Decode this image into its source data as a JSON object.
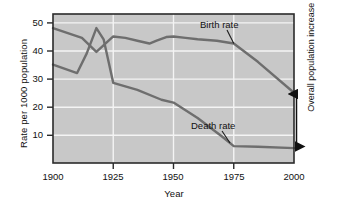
{
  "chart_data": {
    "type": "line",
    "title": "",
    "xlabel": "Year",
    "ylabel": "Rate per 1000 population",
    "xlim": [
      1900,
      2000
    ],
    "ylim": [
      0,
      53
    ],
    "xticks": [
      1900,
      1925,
      1950,
      1975,
      2000
    ],
    "yticks": [
      10,
      20,
      30,
      40,
      50
    ],
    "grid": true,
    "legend_position": "inline-annotations",
    "background_color": "#c8c8c8",
    "gridline_color": "#f2f2f2",
    "line_color": "#6b6b6b",
    "border_color": "#2b2b2b",
    "series": [
      {
        "name": "Birth rate",
        "x": [
          1900,
          1912,
          1918,
          1925,
          1930,
          1935,
          1940,
          1943,
          1947,
          1950,
          1955,
          1960,
          1968,
          1975,
          1985,
          2000
        ],
        "values": [
          48,
          44.5,
          39.5,
          45,
          44.5,
          43.5,
          42.5,
          43.5,
          44.8,
          45,
          44.5,
          44,
          43.5,
          42.5,
          36,
          25
        ]
      },
      {
        "name": "Death rate",
        "x": [
          1900,
          1910,
          1914,
          1918,
          1921,
          1925,
          1935,
          1945,
          1950,
          1960,
          1970,
          1975,
          1985,
          2000
        ],
        "values": [
          35,
          32,
          39,
          48,
          44,
          28.5,
          26,
          22.5,
          21.5,
          16,
          9.5,
          6,
          5.8,
          5.3
        ]
      }
    ],
    "annotations": [
      {
        "name": "birth-rate-label",
        "text": "Birth rate",
        "target_x": 1975,
        "target_y": 42.5
      },
      {
        "name": "death-rate-label",
        "text": "Death rate",
        "target_x": 1975,
        "target_y": 6
      },
      {
        "name": "overall-population-increase",
        "text": "Overall population increase",
        "at_x": 2000,
        "from_y": 5.3,
        "to_y": 25,
        "arrow": "double-headed"
      }
    ]
  },
  "axes": {
    "y_title": "Rate per 1000 population",
    "x_title": "Year",
    "y_tick_labels": [
      "50",
      "40",
      "30",
      "20",
      "10"
    ],
    "x_tick_labels": [
      "1900",
      "1925",
      "1950",
      "1975",
      "2000"
    ]
  },
  "labels": {
    "birth_rate": "Birth rate",
    "death_rate": "Death rate",
    "overall_increase": "Overall population increase"
  }
}
